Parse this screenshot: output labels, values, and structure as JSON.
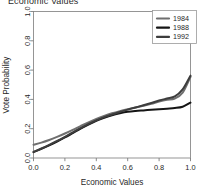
{
  "chart_data": {
    "type": "line",
    "title": "Economic Values",
    "xlabel": "Economic Values",
    "ylabel": "Vote Probability",
    "xlim": [
      0.0,
      1.0
    ],
    "ylim": [
      0.0,
      1.0
    ],
    "grid": false,
    "legend_position": "top-right",
    "xticks": [
      "0.0",
      "0.2",
      "0.4",
      "0.6",
      "0.8",
      "1.0"
    ],
    "xtick_values": [
      0.0,
      0.2,
      0.4,
      0.6,
      0.8,
      1.0
    ],
    "yticks": [
      "0.0",
      "0.2",
      "0.4",
      "0.6",
      "0.8",
      "1.0"
    ],
    "ytick_values": [
      0.0,
      0.2,
      0.4,
      0.6,
      0.8,
      1.0
    ],
    "x": [
      0.0,
      0.05,
      0.1,
      0.15,
      0.2,
      0.25,
      0.3,
      0.35,
      0.4,
      0.45,
      0.5,
      0.55,
      0.6,
      0.65,
      0.7,
      0.75,
      0.8,
      0.85,
      0.9,
      0.95,
      1.0
    ],
    "series": [
      {
        "name": "1984",
        "color": "#6f6f6f",
        "values": [
          0.09,
          0.105,
          0.123,
          0.144,
          0.167,
          0.192,
          0.218,
          0.243,
          0.266,
          0.287,
          0.305,
          0.32,
          0.333,
          0.345,
          0.357,
          0.37,
          0.386,
          0.398,
          0.406,
          0.446,
          0.555
        ]
      },
      {
        "name": "1988",
        "color": "#151515",
        "values": [
          0.04,
          0.062,
          0.086,
          0.112,
          0.14,
          0.17,
          0.2,
          0.228,
          0.253,
          0.274,
          0.292,
          0.305,
          0.315,
          0.321,
          0.325,
          0.329,
          0.333,
          0.337,
          0.341,
          0.35,
          0.378
        ]
      },
      {
        "name": "1992",
        "color": "#3d3d3d",
        "values": [
          0.042,
          0.065,
          0.09,
          0.117,
          0.145,
          0.175,
          0.204,
          0.232,
          0.257,
          0.279,
          0.297,
          0.314,
          0.33,
          0.345,
          0.36,
          0.376,
          0.392,
          0.406,
          0.42,
          0.468,
          0.562
        ]
      }
    ]
  },
  "legend": {
    "entries": [
      {
        "label": "1984"
      },
      {
        "label": "1988"
      },
      {
        "label": "1992"
      }
    ]
  }
}
